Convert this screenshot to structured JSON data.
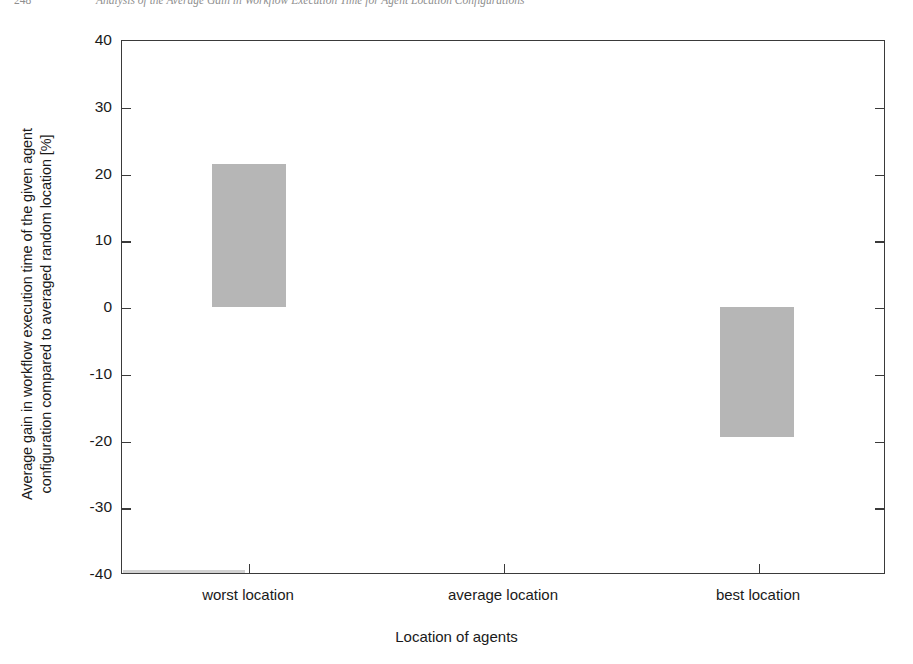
{
  "page_header": {
    "page_number": "248",
    "running_title": "Analysis of the Average Gain in Workflow Execution Time for Agent Location Configurations"
  },
  "chart_data": {
    "type": "bar",
    "title": "",
    "subtitle": "",
    "categories": [
      "worst location",
      "average location",
      "best location"
    ],
    "values": [
      21.5,
      0.0,
      -19.5
    ],
    "xlabel": "Location of agents",
    "ylabel": "Average gain in workflow execution time of the given agent configuration compared to averaged random location [%]",
    "ylabel_line1": "Average gain in workflow execution time of the given agent",
    "ylabel_line2": "configuration compared to averaged random location [%]",
    "ylim": [
      -40,
      40
    ],
    "yticks": [
      40,
      30,
      20,
      10,
      0,
      -10,
      -20,
      -30,
      -40
    ],
    "ytick_labels": [
      "40",
      "30",
      "20",
      "10",
      "0",
      "-10",
      "-20",
      "-30",
      "-40"
    ],
    "grid": false,
    "legend": false,
    "bar_color": "#b6b6b6",
    "axis_color": "#3a3a3a",
    "bar_width_fraction": 0.29,
    "series": [
      {
        "name": "Average gain [%]",
        "values": [
          21.5,
          0.0,
          -19.5
        ]
      }
    ],
    "annotations": []
  }
}
